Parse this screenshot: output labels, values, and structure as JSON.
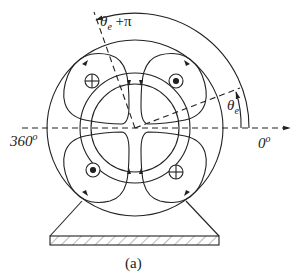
{
  "figure": {
    "caption": "(a)",
    "labels": {
      "angle_top": "θ",
      "angle_top_sub": "e",
      "angle_top_suffix": " +π",
      "angle_right": "θ",
      "angle_right_sub": "e",
      "deg_left": "360",
      "deg_right": "0",
      "deg_symbol": "o"
    },
    "conductors": [
      {
        "position": "upper-left",
        "type": "cross"
      },
      {
        "position": "upper-right",
        "type": "dot"
      },
      {
        "position": "lower-left",
        "type": "dot"
      },
      {
        "position": "lower-right",
        "type": "cross"
      }
    ],
    "colors": {
      "stroke": "#222222",
      "background": "#ffffff"
    }
  }
}
